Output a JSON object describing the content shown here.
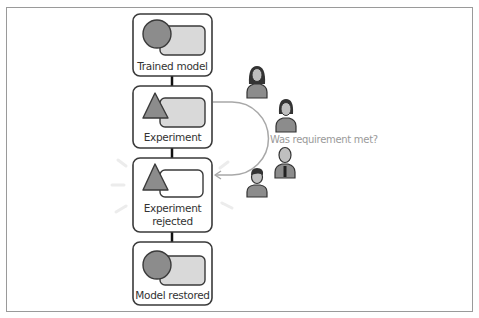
{
  "diagram": {
    "stages": [
      {
        "id": "trained-model",
        "label": "Trained model",
        "shape": "circle-model-icon"
      },
      {
        "id": "experiment",
        "label": "Experiment",
        "shape": "triangle-experiment-icon"
      },
      {
        "id": "experiment-rejected",
        "label_line1": "Experiment",
        "label_line2": "rejected",
        "shape": "triangle-experiment-icon"
      },
      {
        "id": "model-restored",
        "label": "Model restored",
        "shape": "circle-model-icon"
      }
    ],
    "question": "Was requirement met?",
    "reviewers": [
      "person-icon-woman-long-hair",
      "person-icon-woman",
      "person-icon-man-tie",
      "person-icon-man"
    ],
    "colors": {
      "box_border": "#3a3a3a",
      "shape_dark": "#8c8c8c",
      "shape_light": "#d9d9d9",
      "arrow": "#a8a8a8",
      "question_text": "#9a9a9a",
      "frame": "#9a9a9a"
    }
  }
}
